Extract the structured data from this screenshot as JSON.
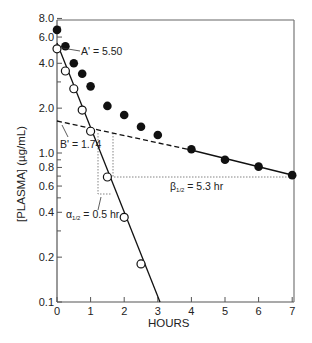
{
  "chart_data": {
    "type": "scatter",
    "title": "",
    "xlabel": "HOURS",
    "ylabel": "[PLASMA] (µg/mL)",
    "yscale": "log",
    "xlim": [
      0,
      7
    ],
    "ylim": [
      0.1,
      8.0
    ],
    "x_ticks": [
      0,
      1,
      2,
      3,
      4,
      5,
      6,
      7
    ],
    "y_ticks": [
      0.1,
      0.2,
      0.4,
      0.6,
      0.8,
      1.0,
      2.0,
      4.0,
      6.0,
      8.0
    ],
    "y_tick_labels": [
      "0.1",
      "0.2",
      "0.4",
      "0.6",
      "0.8",
      "1.0",
      "2.0",
      "4.0",
      "6.0",
      "8.0"
    ],
    "grid": false,
    "series": [
      {
        "name": "Observed plasma concentration",
        "marker": "filled-circle",
        "x": [
          0,
          0.25,
          0.5,
          0.75,
          1.0,
          1.5,
          2.0,
          2.5,
          3.0,
          4.0,
          5.0,
          6.0,
          7.0
        ],
        "y": [
          6.7,
          5.2,
          4.0,
          3.4,
          2.8,
          2.07,
          1.8,
          1.5,
          1.32,
          1.06,
          0.9,
          0.81,
          0.71
        ]
      },
      {
        "name": "Residual (distribution phase)",
        "marker": "open-circle",
        "x": [
          0,
          0.25,
          0.5,
          0.75,
          1.0,
          1.5,
          2.0,
          2.5
        ],
        "y": [
          5.0,
          3.55,
          2.7,
          1.94,
          1.4,
          0.69,
          0.37,
          0.18
        ]
      }
    ],
    "lines": [
      {
        "name": "alpha phase fit",
        "style": "solid",
        "from": [
          0,
          5.5
        ],
        "to": [
          3.0,
          0.1
        ]
      },
      {
        "name": "beta phase extrapolation",
        "style": "dashed",
        "from": [
          0,
          1.74
        ],
        "to": [
          4.0,
          1.03
        ]
      },
      {
        "name": "beta phase fit",
        "style": "solid",
        "from": [
          4.0,
          1.03
        ],
        "to": [
          7.0,
          0.71
        ]
      }
    ],
    "annotations": [
      {
        "text": "A' = 5.50",
        "points_to": [
          0,
          5.5
        ]
      },
      {
        "text": "B' = 1.74",
        "points_to": [
          0,
          1.74
        ]
      },
      {
        "text": "α½ = 0.5 hr",
        "label": "alpha half-life"
      },
      {
        "text": "β½ = 5.3 hr",
        "label": "beta half-life"
      }
    ]
  },
  "labels": {
    "xlabel": "HOURS",
    "ylabel": "[PLASMA] (µg/mL)",
    "a_prime": "A' = 5.50",
    "b_prime": "B' = 1.74",
    "alpha_sym": "α",
    "alpha_sub": "1/2",
    "alpha_rest": " = 0.5 hr",
    "beta_sym": "β",
    "beta_sub": "1/2",
    "beta_rest": " = 5.3 hr",
    "x_ticks": [
      "0",
      "1",
      "2",
      "3",
      "4",
      "5",
      "6",
      "7"
    ],
    "y_ticks": [
      "8.0",
      "6.0",
      "4.0",
      "2.0",
      "1.0",
      "0.8",
      "0.6",
      "0.4",
      "0.2",
      "0.1"
    ]
  }
}
